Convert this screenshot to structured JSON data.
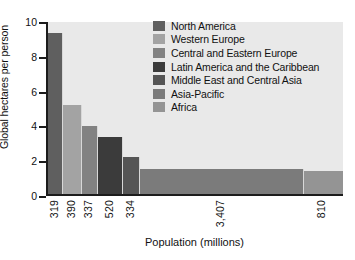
{
  "chart_data": {
    "type": "bar",
    "title": "",
    "subtitle": "",
    "xlabel": "Population (millions)",
    "ylabel": "Global hectares per person",
    "ylim": [
      0,
      10
    ],
    "y_ticks": [
      0,
      2,
      4,
      6,
      8,
      10
    ],
    "grid": false,
    "legend_position": "top-right",
    "note": "Variable-width bar chart: bar width is proportional to population, bar height is ecological footprint in global hectares per person.",
    "categories": [
      "North America",
      "Western Europe",
      "Central and Eastern Europe",
      "Latin America and the Caribbean",
      "Middle East and Central Asia",
      "Asia-Pacific",
      "Africa"
    ],
    "values": [
      9.25,
      5.1,
      3.9,
      3.3,
      2.15,
      1.45,
      1.3
    ],
    "widths": [
      319,
      390,
      337,
      520,
      334,
      3407,
      810
    ],
    "x_tick_labels": [
      "319",
      "390",
      "337",
      "520",
      "334",
      "3,407",
      "810"
    ],
    "colors": [
      "#5f5f5f",
      "#a3a3a3",
      "#828282",
      "#3b3b3b",
      "#555555",
      "#7b7b7b",
      "#949494"
    ],
    "series": [
      {
        "name": "Ecological footprint",
        "points": [
          {
            "label": "North America",
            "population": 319,
            "value": 9.25,
            "color": "#5f5f5f"
          },
          {
            "label": "Western Europe",
            "population": 390,
            "value": 5.1,
            "color": "#a3a3a3"
          },
          {
            "label": "Central and Eastern Europe",
            "population": 337,
            "value": 3.9,
            "color": "#828282"
          },
          {
            "label": "Latin America and the Caribbean",
            "population": 520,
            "value": 3.3,
            "color": "#3b3b3b"
          },
          {
            "label": "Middle East and Central Asia",
            "population": 334,
            "value": 2.15,
            "color": "#555555"
          },
          {
            "label": "Asia-Pacific",
            "population": 3407,
            "value": 1.45,
            "color": "#7b7b7b"
          },
          {
            "label": "Africa",
            "population": 810,
            "value": 1.3,
            "color": "#949494"
          }
        ]
      }
    ]
  },
  "axes": {
    "y_label": "Global hectares per person",
    "x_label": "Population (millions)",
    "y_ticks": [
      "10",
      "8",
      "6",
      "4",
      "2",
      "0"
    ],
    "x_ticks": [
      "319",
      "390",
      "337",
      "520",
      "334",
      "3,407",
      "810"
    ]
  },
  "legend": {
    "items": [
      {
        "label": "North America",
        "color": "#5f5f5f"
      },
      {
        "label": "Western Europe",
        "color": "#a3a3a3"
      },
      {
        "label": "Central and Eastern Europe",
        "color": "#828282"
      },
      {
        "label": "Latin America and the Caribbean",
        "color": "#3b3b3b"
      },
      {
        "label": "Middle East and Central Asia",
        "color": "#555555"
      },
      {
        "label": "Asia-Pacific",
        "color": "#7b7b7b"
      },
      {
        "label": "Africa",
        "color": "#949494"
      }
    ]
  },
  "style": {
    "plot_background": "#e9e9e9",
    "page_background": "#ffffff",
    "axis_color": "#1c1c1c",
    "text_color": "#111111"
  }
}
